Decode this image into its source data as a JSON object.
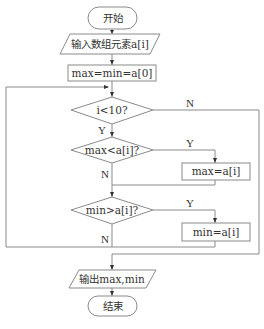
{
  "diagram": {
    "type": "flowchart",
    "nodes": {
      "start": {
        "shape": "terminal",
        "text": "开始"
      },
      "input": {
        "shape": "parallelogram",
        "text": "输入数组元素a[i]"
      },
      "init": {
        "shape": "process",
        "text": "max=min=a[0]"
      },
      "loop_cond": {
        "shape": "decision",
        "text": "i<10?"
      },
      "max_cond": {
        "shape": "decision",
        "text": "max<a[i]?"
      },
      "max_assign": {
        "shape": "process",
        "text": "max=a[i]"
      },
      "min_cond": {
        "shape": "decision",
        "text": "min>a[i]?"
      },
      "min_assign": {
        "shape": "process",
        "text": "min=a[i]"
      },
      "output": {
        "shape": "parallelogram",
        "text": "输出max,min"
      },
      "end": {
        "shape": "terminal",
        "text": "结束"
      }
    },
    "edge_labels": {
      "loop_no": "N",
      "loop_yes": "Y",
      "max_yes": "Y",
      "max_no": "N",
      "min_yes": "Y",
      "min_no": "N"
    },
    "edges": [
      {
        "from": "start",
        "to": "input"
      },
      {
        "from": "input",
        "to": "init"
      },
      {
        "from": "init",
        "to": "loop_cond"
      },
      {
        "from": "loop_cond",
        "to": "max_cond",
        "label": "Y"
      },
      {
        "from": "loop_cond",
        "to": "output",
        "label": "N"
      },
      {
        "from": "max_cond",
        "to": "max_assign",
        "label": "Y"
      },
      {
        "from": "max_cond",
        "to": "min_cond",
        "label": "N"
      },
      {
        "from": "max_assign",
        "to": "min_cond"
      },
      {
        "from": "min_cond",
        "to": "min_assign",
        "label": "Y"
      },
      {
        "from": "min_cond",
        "to": "loop_cond",
        "label": "N"
      },
      {
        "from": "min_assign",
        "to": "loop_cond"
      },
      {
        "from": "output",
        "to": "end"
      }
    ]
  }
}
